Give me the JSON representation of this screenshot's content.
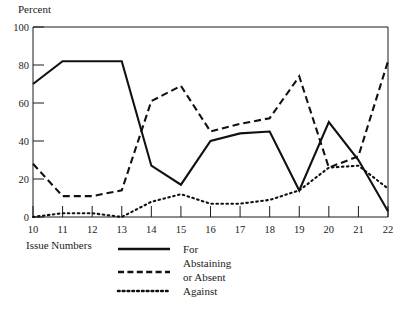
{
  "chart_data": {
    "type": "line",
    "title": "",
    "xlabel": "Issue Numbers",
    "ylabel": "Percent",
    "x": [
      10,
      11,
      12,
      13,
      14,
      15,
      16,
      17,
      18,
      19,
      20,
      21,
      22
    ],
    "xlim": [
      10,
      22
    ],
    "ylim": [
      0,
      100
    ],
    "xticks": [
      "10",
      "11",
      "12",
      "13",
      "14",
      "15",
      "16",
      "17",
      "18",
      "19",
      "20",
      "21",
      "22"
    ],
    "yticks": [
      "0",
      "20",
      "40",
      "60",
      "80",
      "100"
    ],
    "grid": false,
    "legend_position": "bottom-center",
    "series": [
      {
        "name": "For",
        "style": "solid",
        "values": [
          70,
          82,
          82,
          82,
          27,
          17,
          40,
          44,
          45,
          14,
          50,
          30,
          3
        ]
      },
      {
        "name": "Abstaining or Absent",
        "style": "dashed",
        "values": [
          28,
          11,
          11,
          14,
          61,
          69,
          45,
          49,
          52,
          74,
          26,
          32,
          82
        ]
      },
      {
        "name": "Against",
        "style": "dotted",
        "values": [
          0,
          2,
          2,
          0,
          8,
          12,
          7,
          7,
          9,
          14,
          26,
          27,
          15
        ]
      }
    ]
  },
  "axes": {
    "y_title": "Percent",
    "x_title": "Issue Numbers",
    "y_tick_labels": [
      "100",
      "80",
      "60",
      "40",
      "20",
      "0"
    ],
    "x_tick_labels": [
      "10",
      "11",
      "12",
      "13",
      "14",
      "15",
      "16",
      "17",
      "18",
      "19",
      "20",
      "21",
      "22"
    ]
  },
  "legend": {
    "entries": [
      {
        "label_line1": "For",
        "label_line2": "",
        "style": "solid"
      },
      {
        "label_line1": "Abstaining",
        "label_line2": "or Absent",
        "style": "dashed"
      },
      {
        "label_line1": "Against",
        "label_line2": "",
        "style": "dotted"
      }
    ]
  },
  "colors": {
    "line": "#111111",
    "axis": "#1a1a1a",
    "background": "#ffffff"
  }
}
